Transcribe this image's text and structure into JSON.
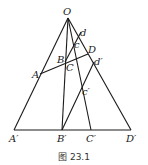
{
  "caption": "图 23.1",
  "points": {
    "O": {
      "label": "O",
      "x": 68,
      "y": 18
    },
    "A": {
      "label": "A",
      "x": 40,
      "y": 74
    },
    "B": {
      "label": "B",
      "x": 65,
      "y": 62
    },
    "C": {
      "label": "C",
      "x": 67,
      "y": 62
    },
    "D": {
      "label": "D",
      "x": 88,
      "y": 54
    },
    "c": {
      "label": "c",
      "x": 75,
      "y": 43
    },
    "d": {
      "label": "d",
      "x": 81,
      "y": 32
    },
    "A1": {
      "label": "A′",
      "x": 14,
      "y": 130
    },
    "B1": {
      "label": "B′",
      "x": 62,
      "y": 130
    },
    "C1": {
      "label": "C′",
      "x": 91,
      "y": 130
    },
    "D1": {
      "label": "D′",
      "x": 131,
      "y": 130
    },
    "c1": {
      "label": "c′",
      "x": 83,
      "y": 88
    },
    "d1": {
      "label": "d′",
      "x": 94,
      "y": 62
    }
  }
}
